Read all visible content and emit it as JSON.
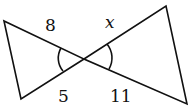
{
  "diagram": {
    "type": "similar-triangles-bowtie",
    "labels": {
      "top_left": "8",
      "top_right": "x",
      "bottom_left": "5",
      "bottom_right": "11"
    },
    "colors": {
      "stroke": "#111111",
      "background": "#ffffff"
    }
  }
}
